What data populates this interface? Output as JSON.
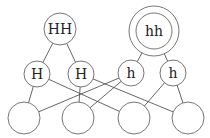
{
  "diagram": {
    "type": "graph",
    "colors": {
      "stroke": "#666666",
      "edge": "#555555",
      "text": "#222222",
      "background": "#ffffff"
    },
    "nodes": [
      {
        "id": "HH",
        "label": "HH",
        "x": 60,
        "y": 29,
        "r": 16,
        "double": false
      },
      {
        "id": "hh",
        "label": "hh",
        "x": 154,
        "y": 31,
        "r": 18,
        "double": true,
        "outer_r": 25
      },
      {
        "id": "H1",
        "label": "H",
        "x": 37,
        "y": 74,
        "r": 13
      },
      {
        "id": "H2",
        "label": "H",
        "x": 81,
        "y": 74,
        "r": 13
      },
      {
        "id": "h1",
        "label": "h",
        "x": 131,
        "y": 73,
        "r": 13
      },
      {
        "id": "h2",
        "label": "h",
        "x": 173,
        "y": 73,
        "r": 13
      },
      {
        "id": "B1",
        "label": "",
        "x": 24,
        "y": 118,
        "r": 16
      },
      {
        "id": "B2",
        "label": "",
        "x": 78,
        "y": 118,
        "r": 16
      },
      {
        "id": "B3",
        "label": "",
        "x": 134,
        "y": 118,
        "r": 16
      },
      {
        "id": "B4",
        "label": "",
        "x": 188,
        "y": 118,
        "r": 16
      }
    ],
    "edges": [
      [
        "HH",
        "H1"
      ],
      [
        "HH",
        "H2"
      ],
      [
        "hh",
        "h1"
      ],
      [
        "hh",
        "h2"
      ],
      [
        "H1",
        "B1"
      ],
      [
        "H1",
        "B3"
      ],
      [
        "H2",
        "B2"
      ],
      [
        "H2",
        "B4"
      ],
      [
        "h1",
        "B1"
      ],
      [
        "h1",
        "B2"
      ],
      [
        "h2",
        "B3"
      ],
      [
        "h2",
        "B4"
      ]
    ]
  }
}
